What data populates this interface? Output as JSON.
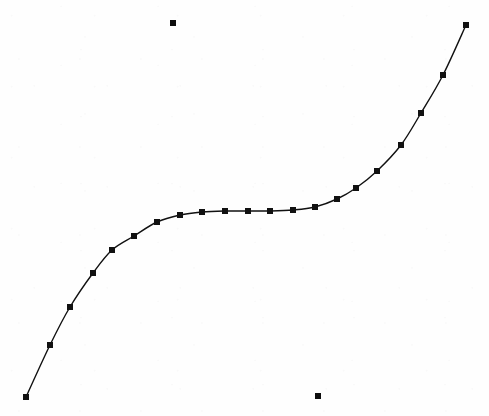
{
  "figure": {
    "title": "",
    "subtitle": "",
    "width": 489,
    "height": 416,
    "background_color": "#fefefe",
    "line_color": "#111111",
    "marker_color": "#0d0d0d",
    "line_width": 1.4,
    "marker_size": 6,
    "marker_shape": "square"
  },
  "chart_data": {
    "type": "line",
    "title": "",
    "subtitle": "",
    "xlabel": "",
    "ylabel": "",
    "xlim": [
      0,
      489
    ],
    "ylim": [
      0,
      416
    ],
    "grid": false,
    "axes_visible": false,
    "tick_labels_x": [],
    "tick_labels_y": [],
    "legend": [],
    "legend_position": "none",
    "annotations": [],
    "series": [
      {
        "name": "s-curve",
        "style": "line-with-square-markers",
        "color": "#111111",
        "marker": "square",
        "points": [
          {
            "x": 26,
            "y": 397
          },
          {
            "x": 50,
            "y": 345
          },
          {
            "x": 70,
            "y": 307
          },
          {
            "x": 93,
            "y": 273
          },
          {
            "x": 112,
            "y": 250
          },
          {
            "x": 134,
            "y": 236
          },
          {
            "x": 157,
            "y": 222
          },
          {
            "x": 180,
            "y": 215
          },
          {
            "x": 202,
            "y": 212
          },
          {
            "x": 225,
            "y": 211
          },
          {
            "x": 248,
            "y": 211
          },
          {
            "x": 270,
            "y": 211
          },
          {
            "x": 293,
            "y": 210
          },
          {
            "x": 315,
            "y": 207
          },
          {
            "x": 337,
            "y": 199
          },
          {
            "x": 356,
            "y": 188
          },
          {
            "x": 377,
            "y": 171
          },
          {
            "x": 401,
            "y": 145
          },
          {
            "x": 421,
            "y": 113
          },
          {
            "x": 443,
            "y": 75
          },
          {
            "x": 466,
            "y": 25
          }
        ]
      },
      {
        "name": "isolated-markers",
        "style": "markers-only",
        "color": "#0d0d0d",
        "marker": "square",
        "points": [
          {
            "x": 173,
            "y": 23
          },
          {
            "x": 318,
            "y": 396
          }
        ]
      }
    ]
  }
}
